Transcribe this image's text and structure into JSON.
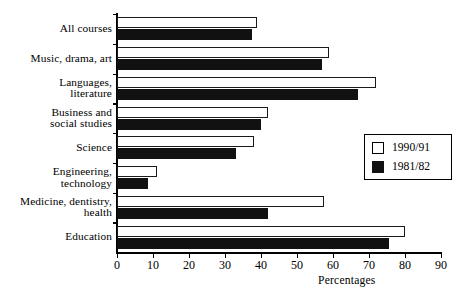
{
  "chart_data": {
    "type": "bar",
    "orientation": "horizontal",
    "title": "",
    "xlabel": "Percentages",
    "ylabel": "",
    "xlim": [
      0,
      90
    ],
    "xticks": [
      0,
      10,
      20,
      30,
      40,
      50,
      60,
      70,
      80,
      90
    ],
    "grid": false,
    "legend_position": "right-middle",
    "categories": [
      "All courses",
      "Music, drama, art",
      "Languages, literature",
      "Business and social studies",
      "Science",
      "Engineering, technology",
      "Medicine, dentistry, health",
      "Education"
    ],
    "category_lines": [
      [
        "All courses"
      ],
      [
        "Music, drama, art"
      ],
      [
        "Languages,",
        "literature"
      ],
      [
        "Business and",
        "social studies"
      ],
      [
        "Science"
      ],
      [
        "Engineering,",
        "technology"
      ],
      [
        "Medicine, dentistry,",
        "health"
      ],
      [
        "Education"
      ]
    ],
    "series": [
      {
        "name": "1990/91",
        "style": "open",
        "color": "#ffffff",
        "edge_color": "#1a1a1a",
        "values": [
          39,
          59,
          72,
          42,
          38,
          11,
          57.5,
          80
        ]
      },
      {
        "name": "1981/82",
        "style": "solid",
        "color": "#111111",
        "edge_color": "#111111",
        "values": [
          37.5,
          57,
          67,
          40,
          33,
          8.5,
          42,
          75.5
        ]
      }
    ]
  },
  "legend": {
    "entries": [
      {
        "label": "1990/91",
        "style": "open"
      },
      {
        "label": "1981/82",
        "style": "solid"
      }
    ]
  },
  "axis": {
    "x_title": "Percentages",
    "tick_labels": [
      "0",
      "10",
      "20",
      "30",
      "40",
      "50",
      "60",
      "70",
      "80",
      "90"
    ]
  }
}
